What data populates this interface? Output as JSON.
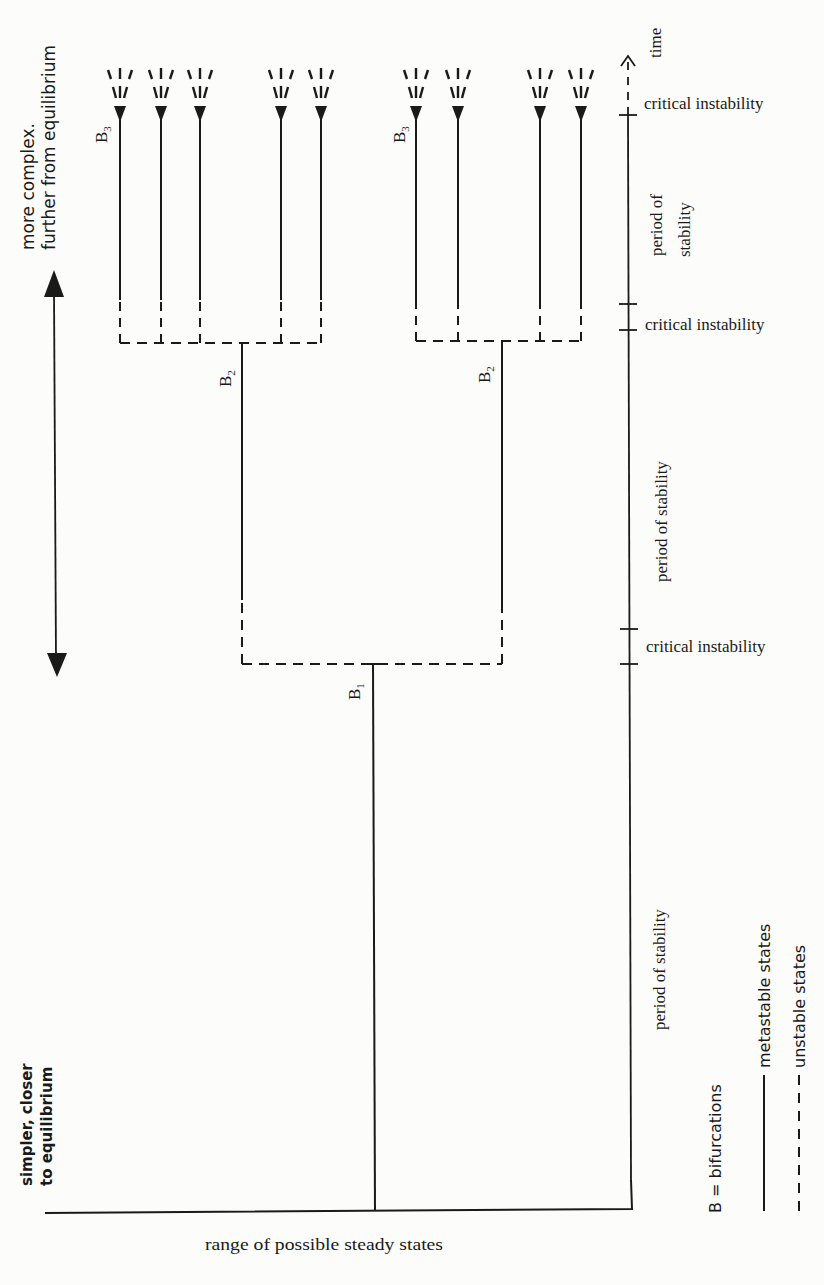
{
  "diagram": {
    "type": "bifurcation-tree",
    "stroke_color": "#1a1a1a",
    "background": "#fcfcfa",
    "left_axis": {
      "top_label_line1": "more complex.",
      "top_label_line2": "further from equilibrium",
      "bottom_label_line1": "simpler, closer",
      "bottom_label_line2": "to equilibrium"
    },
    "time_axis": {
      "label": "time",
      "intervals": [
        {
          "label": "critical instability",
          "kind": "critical"
        },
        {
          "label": "period of stability",
          "kind": "stability",
          "lines": [
            "period of",
            "stability"
          ]
        },
        {
          "label": "critical instability",
          "kind": "critical"
        },
        {
          "label": "period of stability",
          "kind": "stability"
        },
        {
          "label": "critical instability",
          "kind": "critical"
        },
        {
          "label": "period of stability",
          "kind": "stability"
        }
      ]
    },
    "x_axis_label": "range of possible steady states",
    "bifurcations": [
      {
        "label": "B",
        "subscript": "1",
        "level": 1
      },
      {
        "label": "B",
        "subscript": "2",
        "level": 2,
        "side": "left"
      },
      {
        "label": "B",
        "subscript": "2",
        "level": 2,
        "side": "right"
      },
      {
        "label": "B",
        "subscript": "3",
        "level": 3,
        "side": "left"
      },
      {
        "label": "B",
        "subscript": "3",
        "level": 3,
        "side": "right"
      }
    ],
    "branch_counts": {
      "level3_left": 5,
      "level3_right": 4
    },
    "legend": {
      "bifurcations": "B = bifurcations",
      "metastable": "metastable states",
      "unstable": "unstable states"
    }
  }
}
